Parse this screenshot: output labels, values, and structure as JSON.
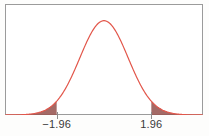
{
  "figure": {
    "title": "",
    "background_color": "#fdfdfc",
    "frame_color": "#9b9b9b",
    "curve_color": "#e2564a",
    "tail_fill_color": "#9a5a55",
    "tick_color": "#8d8d8d",
    "label_color": "#3a3a3a"
  },
  "axis": {
    "ticks": [
      {
        "name": "lower-critical-value",
        "label": "−1.96",
        "value": -1.96
      },
      {
        "name": "upper-critical-value",
        "label": "1.96",
        "value": 1.96
      }
    ]
  },
  "chart_data": {
    "type": "line",
    "title": "",
    "xlabel": "",
    "ylabel": "",
    "grid": false,
    "legend": null,
    "xlim": [
      -4.1,
      4.1
    ],
    "ylim": [
      0,
      0.44
    ],
    "tick_labels": [
      "−1.96",
      "1.96"
    ],
    "tick_values": [
      -1.96,
      1.96
    ],
    "annotations": [],
    "series": [
      {
        "name": "standard-normal-density",
        "kind": "line",
        "color": "#e2564a",
        "x": [
          -4.1,
          -3.9,
          -3.7,
          -3.5,
          -3.3,
          -3.1,
          -2.9,
          -2.7,
          -2.5,
          -2.3,
          -2.1,
          -1.96,
          -1.9,
          -1.7,
          -1.5,
          -1.3,
          -1.1,
          -0.9,
          -0.7,
          -0.5,
          -0.3,
          -0.1,
          0,
          0.1,
          0.3,
          0.5,
          0.7,
          0.9,
          1.1,
          1.3,
          1.5,
          1.7,
          1.9,
          1.96,
          2.1,
          2.3,
          2.5,
          2.7,
          2.9,
          3.1,
          3.3,
          3.5,
          3.7,
          3.9,
          4.1
        ],
        "y": [
          0.0001,
          0.0002,
          0.0004,
          0.0009,
          0.0017,
          0.0033,
          0.006,
          0.0104,
          0.0175,
          0.0283,
          0.044,
          0.0584,
          0.0656,
          0.094,
          0.1295,
          0.1714,
          0.2179,
          0.2661,
          0.3123,
          0.3521,
          0.3814,
          0.397,
          0.3989,
          0.397,
          0.3814,
          0.3521,
          0.3123,
          0.2661,
          0.2179,
          0.1714,
          0.1295,
          0.094,
          0.0656,
          0.0584,
          0.044,
          0.0283,
          0.0175,
          0.0104,
          0.006,
          0.0033,
          0.0017,
          0.0009,
          0.0004,
          0.0002,
          0.0001
        ]
      }
    ],
    "shaded_regions": [
      {
        "name": "left-tail",
        "from": -4.1,
        "to": -1.96,
        "color": "#9a5a55",
        "area": 0.025
      },
      {
        "name": "right-tail",
        "from": 1.96,
        "to": 4.1,
        "color": "#9a5a55",
        "area": 0.025
      }
    ]
  }
}
